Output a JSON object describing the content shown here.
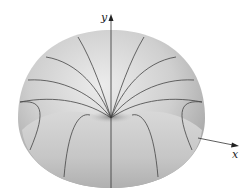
{
  "figure": {
    "axes": {
      "y_label": "y",
      "x_label": "x"
    },
    "colors": {
      "surface_light": "#e6e6e6",
      "surface_mid": "#c4c4c4",
      "surface_dark": "#9a9a9a",
      "line": "#444444",
      "background": "#ffffff"
    },
    "meridian_count": 12
  }
}
